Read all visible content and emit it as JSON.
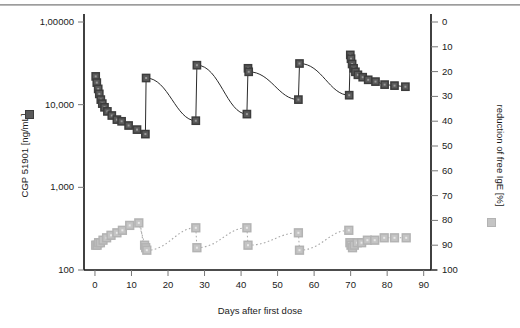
{
  "chart_data": {
    "type": "scatter",
    "title": "",
    "xlabel": "Days after first dose",
    "ylabel": "CGP 51901 [ng/mL]",
    "y2label": "reduction of free IgE [%]",
    "xlim": [
      -3,
      92
    ],
    "xticks": [
      0,
      10,
      20,
      30,
      40,
      50,
      60,
      70,
      80,
      90
    ],
    "xticklabels": [
      "0",
      "10",
      "20",
      "30",
      "40",
      "50",
      "60",
      "70",
      "80",
      "90"
    ],
    "yscale": "log",
    "ylim": [
      100,
      100000
    ],
    "yticks": [
      100000,
      10000,
      1000,
      100
    ],
    "yticklabels": [
      "1,00000",
      "10,000",
      "1,000",
      "100"
    ],
    "y2lim": [
      0,
      100
    ],
    "y2ticks": [
      0,
      10,
      20,
      30,
      40,
      50,
      60,
      70,
      80,
      90,
      100
    ],
    "y2ticklabels": [
      "0",
      "10",
      "20",
      "30",
      "40",
      "50",
      "60",
      "70",
      "80",
      "90",
      "100"
    ],
    "y2_inverted": true,
    "grid": false,
    "legend_position": "axis-titles",
    "series": [
      {
        "name": "CGP 51901 [ng/mL]",
        "axis": "left",
        "marker": "square",
        "color": "#5a5a5a",
        "edge_color": "#3c3c3c",
        "line": "solid",
        "line_color": "#2b2b2b",
        "points": [
          {
            "x": 0.2,
            "y": 22000
          },
          {
            "x": 0.5,
            "y": 18500
          },
          {
            "x": 0.9,
            "y": 15500
          },
          {
            "x": 1.2,
            "y": 13500
          },
          {
            "x": 1.6,
            "y": 11500
          },
          {
            "x": 2.0,
            "y": 10300
          },
          {
            "x": 2.6,
            "y": 9300
          },
          {
            "x": 3.4,
            "y": 8300
          },
          {
            "x": 4.6,
            "y": 7400
          },
          {
            "x": 6.0,
            "y": 6600
          },
          {
            "x": 7.3,
            "y": 6300
          },
          {
            "x": 9.2,
            "y": 5600
          },
          {
            "x": 11.5,
            "y": 5000
          },
          {
            "x": 13.8,
            "y": 4400
          },
          {
            "x": 14.0,
            "y": 21000
          },
          {
            "x": 27.6,
            "y": 6400
          },
          {
            "x": 27.9,
            "y": 30000
          },
          {
            "x": 41.6,
            "y": 7700
          },
          {
            "x": 41.9,
            "y": 27500
          },
          {
            "x": 42.1,
            "y": 25000
          },
          {
            "x": 55.7,
            "y": 11500
          },
          {
            "x": 56.0,
            "y": 31500
          },
          {
            "x": 69.6,
            "y": 13000
          },
          {
            "x": 69.9,
            "y": 40000
          },
          {
            "x": 70.1,
            "y": 36000
          },
          {
            "x": 70.4,
            "y": 31000
          },
          {
            "x": 70.8,
            "y": 27500
          },
          {
            "x": 71.3,
            "y": 25000
          },
          {
            "x": 72.0,
            "y": 23000
          },
          {
            "x": 73.3,
            "y": 21500
          },
          {
            "x": 74.8,
            "y": 20000
          },
          {
            "x": 76.8,
            "y": 19000
          },
          {
            "x": 79.3,
            "y": 17500
          },
          {
            "x": 82.0,
            "y": 17000
          },
          {
            "x": 85.0,
            "y": 16500
          }
        ]
      },
      {
        "name": "reduction of free IgE [%]",
        "axis": "right",
        "marker": "square",
        "color": "#c4c4c4",
        "edge_color": "#b3b3b3",
        "line": "dotted",
        "line_color": "#a8a8a8",
        "points": [
          {
            "x": 0.2,
            "y": 90
          },
          {
            "x": 0.6,
            "y": 90
          },
          {
            "x": 1.0,
            "y": 89
          },
          {
            "x": 1.5,
            "y": 89
          },
          {
            "x": 2.2,
            "y": 88
          },
          {
            "x": 3.2,
            "y": 87
          },
          {
            "x": 4.4,
            "y": 86
          },
          {
            "x": 6.0,
            "y": 85
          },
          {
            "x": 7.5,
            "y": 84
          },
          {
            "x": 9.5,
            "y": 82
          },
          {
            "x": 12.0,
            "y": 81
          },
          {
            "x": 13.6,
            "y": 90
          },
          {
            "x": 13.9,
            "y": 91
          },
          {
            "x": 14.2,
            "y": 92
          },
          {
            "x": 27.6,
            "y": 83
          },
          {
            "x": 27.9,
            "y": 91
          },
          {
            "x": 41.6,
            "y": 83
          },
          {
            "x": 41.9,
            "y": 90
          },
          {
            "x": 55.7,
            "y": 85
          },
          {
            "x": 56.0,
            "y": 92
          },
          {
            "x": 69.5,
            "y": 84
          },
          {
            "x": 69.8,
            "y": 89
          },
          {
            "x": 70.1,
            "y": 90
          },
          {
            "x": 70.5,
            "y": 91
          },
          {
            "x": 71.0,
            "y": 90
          },
          {
            "x": 71.8,
            "y": 89
          },
          {
            "x": 73.0,
            "y": 89
          },
          {
            "x": 74.6,
            "y": 88
          },
          {
            "x": 76.6,
            "y": 88
          },
          {
            "x": 79.2,
            "y": 87
          },
          {
            "x": 82.0,
            "y": 87
          },
          {
            "x": 85.2,
            "y": 87
          }
        ]
      }
    ]
  }
}
